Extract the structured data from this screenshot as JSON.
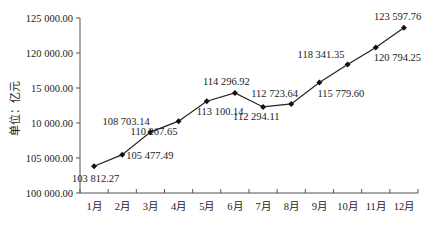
{
  "chart_data": {
    "type": "line",
    "title": "",
    "xlabel": "",
    "ylabel": "单位：亿元",
    "categories": [
      "1月",
      "2月",
      "3月",
      "4月",
      "5月",
      "6月",
      "7月",
      "8月",
      "9月",
      "10月",
      "11月",
      "12月"
    ],
    "series": [
      {
        "name": "",
        "values": [
          103812.27,
          105477.49,
          108703.14,
          110267.65,
          113100.14,
          114296.92,
          112294.11,
          112723.64,
          115779.6,
          118341.35,
          120794.25,
          123597.76
        ]
      }
    ],
    "data_labels": [
      "103 812.27",
      "105 477.49",
      "108 703.14",
      "110 267.65",
      "113 100.14",
      "114 296.92",
      "112 294.11",
      "112 723.64",
      "115 779.60",
      "118 341.35",
      "120 794.25",
      "123 597.76"
    ],
    "y_ticks": [
      100000,
      105000,
      110000,
      115000,
      120000,
      125000
    ],
    "y_tick_labels": [
      "100 000.00",
      "105 000.00",
      "10 000.00",
      "15 000.00",
      "120 000.00",
      "125 000.00"
    ],
    "ylim": [
      100000,
      125000
    ],
    "grid": false,
    "legend": null,
    "marker": "diamond",
    "line_color": "#222222"
  }
}
